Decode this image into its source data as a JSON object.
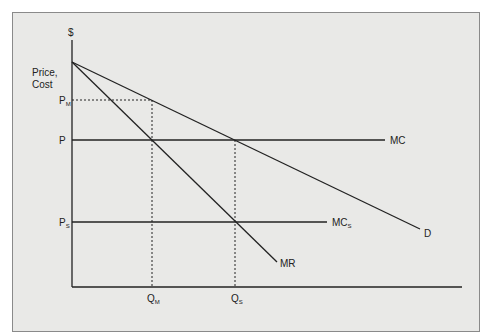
{
  "diagram": {
    "axis_y_label": "$",
    "axis_y_title_line1": "Price,",
    "axis_y_title_line2": "Cost",
    "price_labels": [
      {
        "main": "P",
        "sub": "M"
      },
      {
        "main": "P",
        "sub": ""
      },
      {
        "main": "P",
        "sub": "S"
      }
    ],
    "quantity_labels": [
      {
        "main": "Q",
        "sub": "M"
      },
      {
        "main": "Q",
        "sub": "S"
      }
    ],
    "curve_labels": {
      "mc": {
        "main": "MC",
        "sub": ""
      },
      "mc_s": {
        "main": "MC",
        "sub": "S"
      },
      "demand": {
        "main": "D",
        "sub": ""
      },
      "marginal_revenue": {
        "main": "MR",
        "sub": ""
      }
    },
    "colors": {
      "background": "#e9e9e7",
      "line": "#222222",
      "frame": "#8a8a8a"
    }
  }
}
